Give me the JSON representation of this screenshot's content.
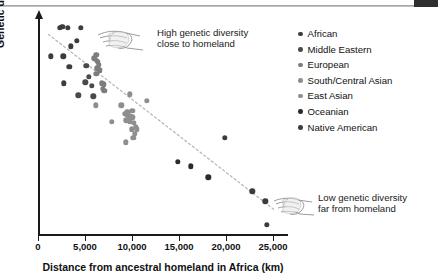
{
  "figure": {
    "title": "",
    "ylabel": "Genetic diversity",
    "xlabel": "Distance from ancestral homeland in Africa (km)",
    "xticklabels": [
      "0",
      "5,000",
      "10,000",
      "15,000",
      "20,000",
      "25,000"
    ],
    "annotations": [
      {
        "name": "high-diversity-annotation",
        "line1": "High genetic diversity",
        "line2": "close to homeland",
        "icon": "pointing-hand-icon"
      },
      {
        "name": "low-diversity-annotation",
        "line1": "Low genetic diversity",
        "line2": "far from homeland",
        "icon": "pointing-hand-icon"
      }
    ],
    "legend": {
      "position": "right",
      "items": [
        {
          "label": "African",
          "color": "#3c3c3c"
        },
        {
          "label": "Middle Eastern",
          "color": "#4a4a4a"
        },
        {
          "label": "European",
          "color": "#7d7d7d"
        },
        {
          "label": "South/Central Asian",
          "color": "#8e8e8e"
        },
        {
          "label": "East Asian",
          "color": "#8e8e8e"
        },
        {
          "label": "Oceanian",
          "color": "#2b2b2b"
        },
        {
          "label": "Native American",
          "color": "#3c3c3c"
        }
      ]
    },
    "colors": {
      "axis": "#1a1a1a",
      "trendline": "#b4b4b4",
      "background": "#ffffff"
    }
  },
  "chart_data": {
    "type": "scatter",
    "title": "",
    "xlabel": "Distance from ancestral homeland in Africa (km)",
    "ylabel": "Genetic diversity",
    "xlim": [
      0,
      26600
    ],
    "ylim": [
      0,
      1
    ],
    "grid": false,
    "legend_position": "right",
    "xticks": [
      0,
      5000,
      10000,
      15000,
      20000,
      25000
    ],
    "xticklabels": [
      "0",
      "5,000",
      "10,000",
      "15,000",
      "20,000",
      "25,000"
    ],
    "yticks": [],
    "yticklabels": [],
    "trendline": {
      "x": [
        1100,
        25300
      ],
      "y": [
        0.925,
        0.115
      ],
      "style": "dotted",
      "color": "#b4b4b4"
    },
    "series": [
      {
        "name": "African",
        "color": "#3c3c3c",
        "points": [
          [
            2350,
            0.955
          ],
          [
            2600,
            0.96
          ],
          [
            3150,
            0.955
          ],
          [
            4550,
            0.955
          ],
          [
            3500,
            0.87
          ],
          [
            4150,
            0.895
          ],
          [
            1350,
            0.825
          ],
          [
            2700,
            0.825
          ],
          [
            3350,
            0.775
          ],
          [
            2750,
            0.7
          ]
        ]
      },
      {
        "name": "Middle Eastern",
        "color": "#4a4a4a",
        "points": [
          [
            5150,
            0.78
          ],
          [
            5400,
            0.73
          ],
          [
            5050,
            0.705
          ],
          [
            5750,
            0.69
          ],
          [
            4300,
            0.645
          ],
          [
            5900,
            0.64
          ]
        ]
      },
      {
        "name": "European",
        "color": "#7d7d7d",
        "points": [
          [
            6000,
            0.815
          ],
          [
            6200,
            0.83
          ],
          [
            6250,
            0.805
          ],
          [
            6350,
            0.8
          ],
          [
            6450,
            0.785
          ],
          [
            6300,
            0.77
          ],
          [
            6550,
            0.76
          ],
          [
            6200,
            0.745
          ],
          [
            6800,
            0.7
          ],
          [
            7000,
            0.695
          ],
          [
            6900,
            0.675
          ],
          [
            7050,
            0.665
          ]
        ]
      },
      {
        "name": "South/Central Asian",
        "color": "#8e8e8e",
        "points": [
          [
            6150,
            0.6
          ],
          [
            8850,
            0.6
          ],
          [
            9800,
            0.65
          ],
          [
            9500,
            0.57
          ],
          [
            9250,
            0.56
          ],
          [
            9500,
            0.555
          ],
          [
            9700,
            0.55
          ],
          [
            9900,
            0.545
          ],
          [
            9400,
            0.53
          ],
          [
            9750,
            0.525
          ],
          [
            10050,
            0.545
          ],
          [
            10200,
            0.52
          ],
          [
            10400,
            0.5
          ],
          [
            10500,
            0.49
          ],
          [
            9350,
            0.43
          ],
          [
            11600,
            0.62
          ],
          [
            7850,
            0.525
          ],
          [
            10050,
            0.575
          ]
        ]
      },
      {
        "name": "East Asian",
        "color": "#8e8e8e",
        "points": [
          [
            9950,
            0.49
          ],
          [
            10300,
            0.47
          ],
          [
            10150,
            0.45
          ]
        ]
      },
      {
        "name": "Oceanian",
        "color": "#2b2b2b",
        "points": [
          [
            14850,
            0.34
          ],
          [
            16250,
            0.32
          ],
          [
            18100,
            0.27
          ]
        ]
      },
      {
        "name": "Native American",
        "color": "#3c3c3c",
        "points": [
          [
            19900,
            0.45
          ],
          [
            22800,
            0.205
          ],
          [
            24200,
            0.16
          ],
          [
            24350,
            0.05
          ]
        ]
      }
    ]
  }
}
